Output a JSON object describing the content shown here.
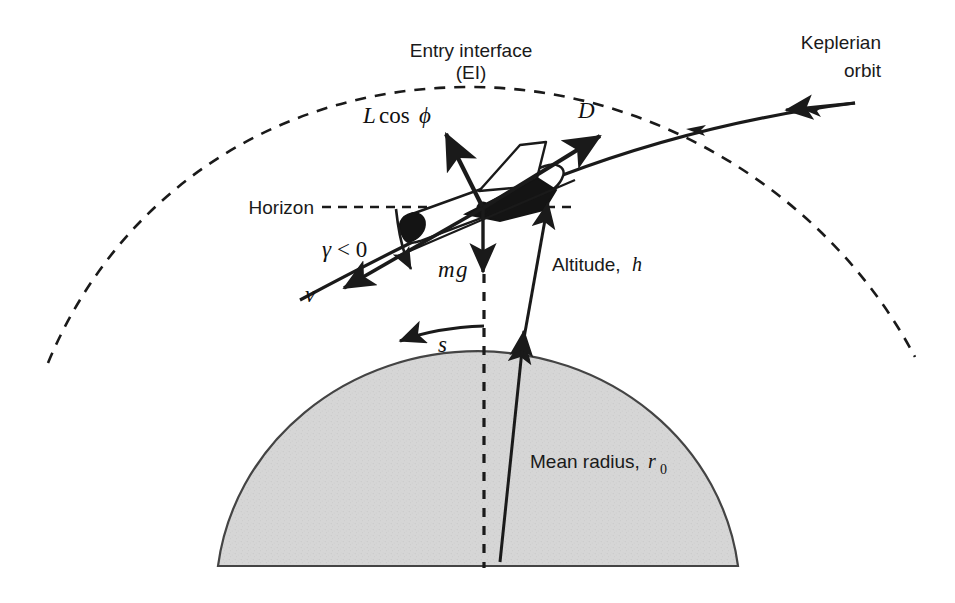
{
  "figure": {
    "title_visible": false,
    "background_color": "#ffffff",
    "stroke_color": "#1a1a1a",
    "earth_fill_color": "#d4d4d4",
    "earth_edge_color": "#3a3a3a"
  },
  "labels": {
    "entry_interface_line1": "Entry interface",
    "entry_interface_line2": "(EI)",
    "keplerian_line1": "Keplerian",
    "keplerian_line2": "orbit",
    "lift": "L",
    "lift_cos": "cos",
    "lift_phi": "ϕ",
    "drag": "D",
    "horizon": "Horizon",
    "flight_path_angle": "γ",
    "flight_path_angle_rel": "< 0",
    "velocity": "v",
    "weight_m": "m",
    "weight_g": "g",
    "altitude_text": "Altitude,",
    "altitude_symbol": "h",
    "range_symbol": "s",
    "mean_radius_text": "Mean radius,",
    "mean_radius_symbol": "r",
    "mean_radius_subscript": "0"
  },
  "elements": {
    "ei_arc": "entry-interface-dashed-arc",
    "earth_body": "earth-surface-shaded-region",
    "vehicle": "entry-vehicle-lifting-body",
    "trajectory": "entry-trajectory-curve",
    "vertical_datum": "vertical-dashed-datum-line",
    "horizon_line": "horizon-dashed-line"
  },
  "geometry": {
    "canvas_width": 955,
    "canvas_height": 603,
    "vehicle_center": [
      483,
      208
    ],
    "horizon_y": 207,
    "earth_apex_y": 325,
    "ei_arc_apex_y": 87
  }
}
